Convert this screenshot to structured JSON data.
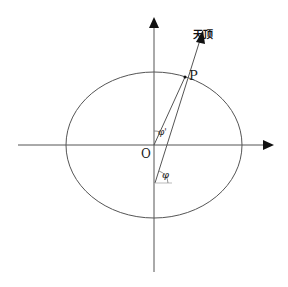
{
  "diagram": {
    "labels": {
      "zenith": "天顶",
      "point": "P",
      "origin": "O",
      "geocentric_angle": "φ'",
      "geodetic_angle": "φ"
    },
    "colors": {
      "line": "#555555",
      "arrow": "#111111",
      "background": "#ffffff"
    }
  }
}
